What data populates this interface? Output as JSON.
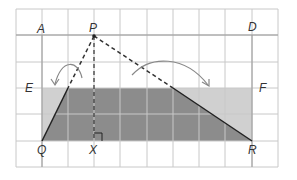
{
  "diagram": {
    "type": "geometry-grid",
    "grid": {
      "columns": 10,
      "rows": 6,
      "line_color": "#c8c8c8"
    },
    "points": [
      {
        "id": "A",
        "label": "A"
      },
      {
        "id": "P",
        "label": "P"
      },
      {
        "id": "D",
        "label": "D"
      },
      {
        "id": "E",
        "label": "E"
      },
      {
        "id": "F",
        "label": "F"
      },
      {
        "id": "Q",
        "label": "Q"
      },
      {
        "id": "X",
        "label": "X"
      },
      {
        "id": "R",
        "label": "R"
      }
    ],
    "shapes": {
      "rectangle_EFRQ": {
        "fill": "#d0d0d0"
      },
      "shaded_region": {
        "fill": "#8c8c8c"
      },
      "dashed_lines": [
        "PQ",
        "PR",
        "PX"
      ],
      "solid_lines": [
        "Q to EF",
        "EF to R"
      ],
      "right_angle_marker": "X"
    },
    "arrows": [
      {
        "name": "left-rotation-arrow",
        "description": "curved arrow from PQ toward E"
      },
      {
        "name": "right-rotation-arrow",
        "description": "curved arrow from PR toward F"
      }
    ],
    "colors": {
      "dark_fill": "#8c8c8c",
      "light_fill": "#d0d0d0",
      "line": "#222222",
      "arrow": "#888888"
    }
  }
}
